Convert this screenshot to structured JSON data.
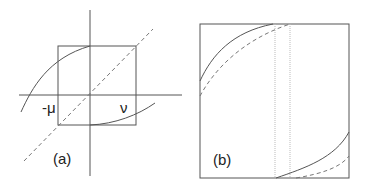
{
  "figure": {
    "panels": [
      {
        "id": "a",
        "label": "(a)",
        "axis_labels": {
          "left": "-μ",
          "right": "ν"
        },
        "elements": [
          "x-axis",
          "y-axis",
          "square-box",
          "dashed-diagonal",
          "upper-left-curve",
          "lower-right-curve"
        ]
      },
      {
        "id": "b",
        "label": "(b)",
        "elements": [
          "square-box",
          "two-dotted-vertical-lines",
          "solid-curves",
          "dashed-curves"
        ]
      }
    ],
    "colors": {
      "line": "#555555",
      "dotted": "#bbbbbb",
      "text": "#222222"
    }
  }
}
